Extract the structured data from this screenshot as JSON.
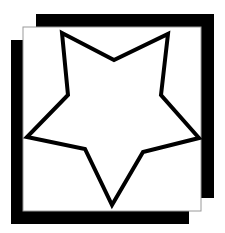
{
  "graphic": {
    "description": "Outlined five-point star inside a square frame with offset black shadow bars",
    "canvas": {
      "width": 225,
      "height": 233,
      "background": "#ffffff"
    },
    "colors": {
      "shadow": "#000000",
      "panel_fill": "#ffffff",
      "panel_border": "#9a9a9a",
      "star_stroke": "#000000",
      "star_fill": "#ffffff"
    },
    "shadow_back": {
      "x": 36,
      "y": 14,
      "width": 178,
      "height": 184
    },
    "shadow_front": {
      "x": 11,
      "y": 40,
      "width": 178,
      "height": 184
    },
    "panel": {
      "x": 23,
      "y": 27,
      "width": 178,
      "height": 184
    },
    "star": {
      "stroke_width": 4,
      "points": [
        [
          62,
          33
        ],
        [
          114,
          60
        ],
        [
          168,
          34
        ],
        [
          161,
          95
        ],
        [
          199,
          138
        ],
        [
          143,
          152
        ],
        [
          112,
          205
        ],
        [
          85,
          149
        ],
        [
          27,
          137
        ],
        [
          68,
          95
        ]
      ]
    }
  }
}
